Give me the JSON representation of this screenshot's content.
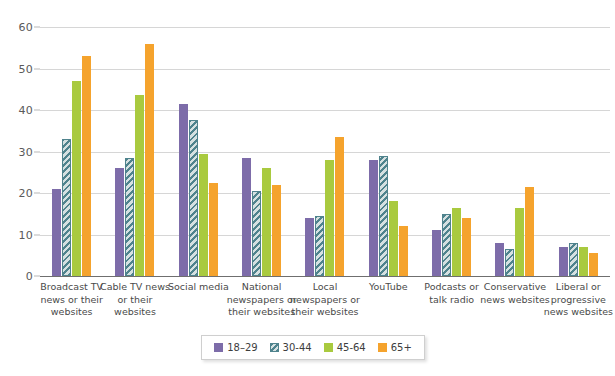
{
  "chart_data": {
    "type": "bar",
    "title": "",
    "subtitle": "",
    "xlabel": "",
    "ylabel": "",
    "ylim": [
      0,
      60
    ],
    "yticks": [
      0,
      10,
      20,
      30,
      40,
      50,
      60
    ],
    "grid": true,
    "legend_position": "bottom",
    "categories": [
      "Broadcast TV news or their websites",
      "Cable TV news or their websites",
      "Social media",
      "National newspapers or their websites",
      "Local newspapers or their websites",
      "YouTube",
      "Podcasts or talk radio",
      "Conservative news websites",
      "Liberal or progressive news websites"
    ],
    "category_lines": [
      [
        "Broadcast TV",
        "news or their",
        "websites"
      ],
      [
        "Cable TV news",
        "or their",
        "websites"
      ],
      [
        "Social media"
      ],
      [
        "National",
        "newspapers or",
        "their websites"
      ],
      [
        "Local",
        "newspapers or",
        "their websites"
      ],
      [
        "YouTube"
      ],
      [
        "Podcasts or",
        "talk radio"
      ],
      [
        "Conservative",
        "news websites"
      ],
      [
        "Liberal or",
        "progressive",
        "news websites"
      ]
    ],
    "series": [
      {
        "name": "18–29",
        "color": "#7d6ca9",
        "values": [
          21,
          26,
          41.5,
          28.5,
          14,
          28,
          11,
          8,
          7
        ]
      },
      {
        "name": "30-44",
        "color": "#4f838d",
        "values": [
          33,
          28.5,
          37.5,
          20.5,
          14.5,
          29,
          15,
          6.5,
          8
        ]
      },
      {
        "name": "45-64",
        "color": "#a9ca3f",
        "values": [
          47,
          43.5,
          29.5,
          26,
          28,
          18,
          16.5,
          16.5,
          7
        ]
      },
      {
        "name": "65+",
        "color": "#f5a32d",
        "values": [
          53,
          56,
          22.5,
          22,
          33.5,
          12,
          14,
          21.5,
          5.5
        ]
      }
    ]
  },
  "legend": {
    "items": [
      {
        "label": "18–29"
      },
      {
        "label": "30-44"
      },
      {
        "label": "45-64"
      },
      {
        "label": "65+"
      }
    ]
  }
}
